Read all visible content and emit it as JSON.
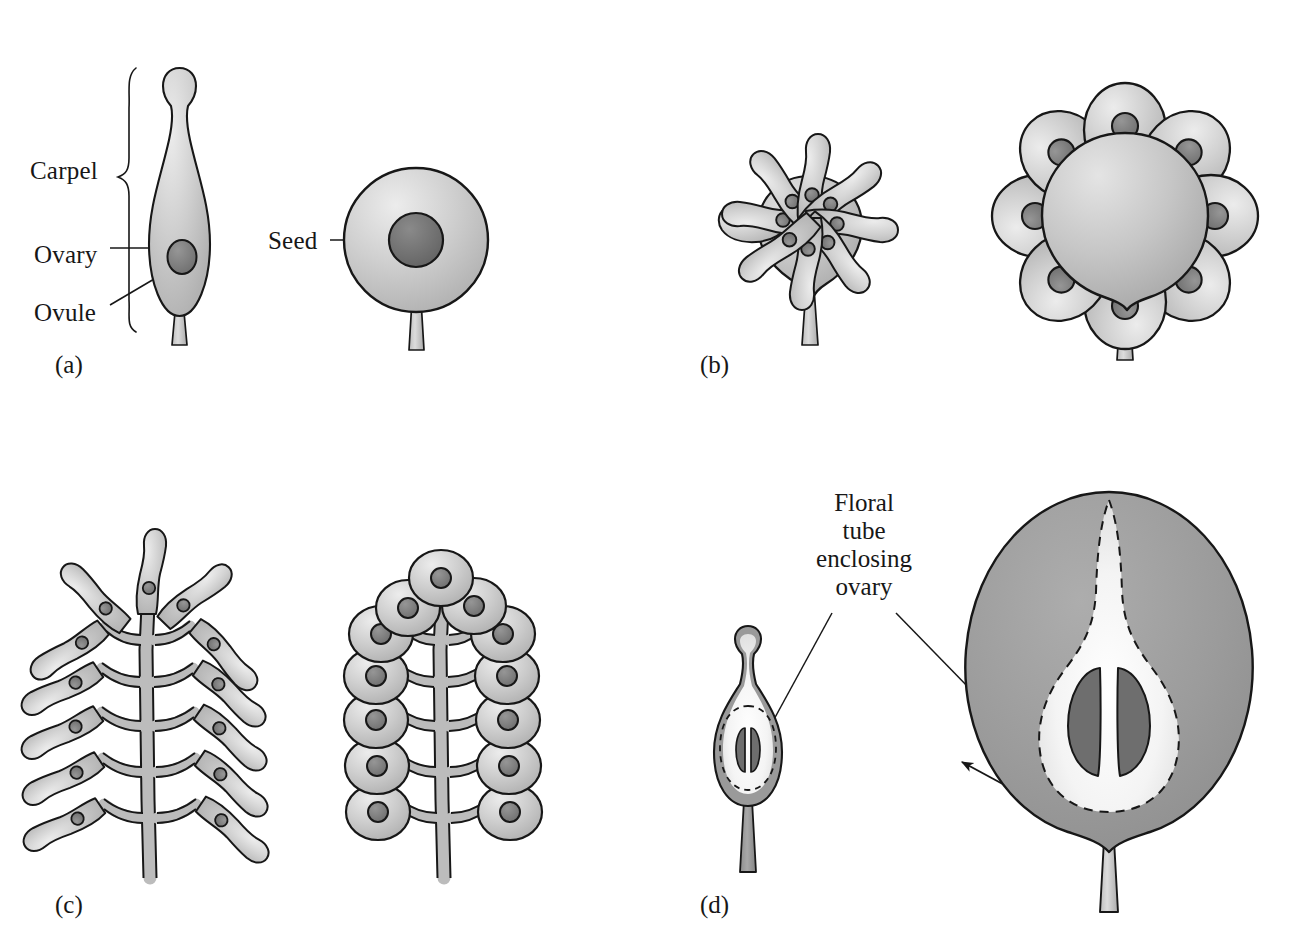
{
  "figure": {
    "background_color": "#ffffff",
    "ink_color": "#171717"
  },
  "palette": {
    "outline": "#171717",
    "tissue_light": "#c9c9c9",
    "tissue_light_hi": "#e6e6e6",
    "tissue_mid": "#b4b4b4",
    "ovule_dark": "#7e7e7e",
    "seed_dark": "#6f6f6f",
    "flesh_dark": "#9a9a9a",
    "ovary_pale": "#f2f2f2",
    "white": "#ffffff"
  },
  "panels": [
    {
      "id": "a",
      "label": "(a)",
      "label_x": 55,
      "label_y": 352,
      "description": "Single carpel in longitudinal section with one ovule, and the resulting single-seeded fruit",
      "annotations": [
        {
          "name": "carpel",
          "text": "Carpel",
          "x": 30,
          "y": 158,
          "leader": "brace"
        },
        {
          "name": "ovary",
          "text": "Ovary",
          "x": 34,
          "y": 242,
          "leader": "straight"
        },
        {
          "name": "ovule",
          "text": "Ovule",
          "x": 34,
          "y": 300,
          "leader": "diagonal"
        },
        {
          "name": "seed",
          "text": "Seed",
          "x": 268,
          "y": 228,
          "leader": "straight"
        }
      ]
    },
    {
      "id": "b",
      "label": "(b)",
      "label_x": 700,
      "label_y": 352,
      "description": "Many separate carpels on a domed receptacle develop into an aggregate of achenes",
      "annotations": [],
      "carpel_count": 8,
      "achene_count": 8
    },
    {
      "id": "c",
      "label": "(c)",
      "label_x": 55,
      "label_y": 892,
      "description": "Carpels borne along a branched axis mature into a cluster of one-seeded fruitlets",
      "annotations": [],
      "carpel_count": 13,
      "fruitlet_count": 13
    },
    {
      "id": "d",
      "label": "(d)",
      "label_x": 700,
      "label_y": 892,
      "description": "Ovary sunk in a floral tube; the tube enlarges to form the fleshy pome",
      "annotations": [
        {
          "name": "floral-tube-enclosing-ovary",
          "text": "Floral tube enclosing ovary",
          "lines": [
            "Floral",
            "tube",
            "enclosing",
            "ovary"
          ],
          "x": 770,
          "y": 492,
          "leader": "two-lines"
        }
      ],
      "ovule_count": 2,
      "seed_count": 2
    }
  ]
}
